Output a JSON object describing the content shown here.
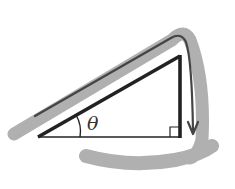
{
  "diagram": {
    "type": "right-triangle",
    "angle_label": "θ",
    "colors": {
      "triangle": "#222222",
      "arrow_path": "#444444",
      "brush": "#a8a8a8",
      "background": "#ffffff"
    },
    "elements": [
      {
        "name": "hypotenuse",
        "desc": "thick dark line from left vertex to top-right vertex"
      },
      {
        "name": "vertical-leg",
        "desc": "thick dark line from top-right to bottom-right"
      },
      {
        "name": "base",
        "desc": "thin line from left vertex to bottom-right"
      },
      {
        "name": "right-angle-marker",
        "desc": "small square at bottom-right corner"
      },
      {
        "name": "angle-arc",
        "desc": "arc at left vertex labeled theta"
      },
      {
        "name": "path-arrow",
        "desc": "line parallel to hypotenuse curving down along vertical leg ending in arrowhead"
      },
      {
        "name": "brush-strokes",
        "desc": "gray highlight strokes along hypotenuse, around top-right and along bottom"
      }
    ]
  }
}
